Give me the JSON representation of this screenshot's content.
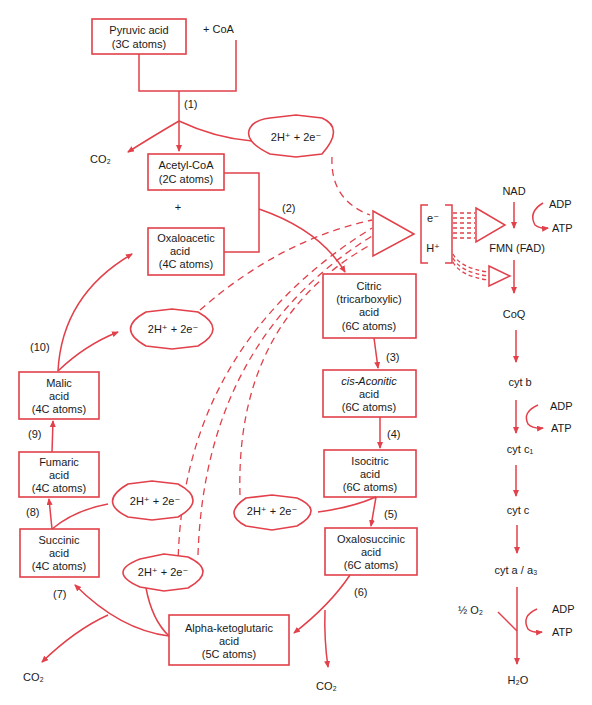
{
  "colors": {
    "line": "#e2404a",
    "text": "#1a1a1a",
    "background": "#ffffff"
  },
  "boxes": {
    "pyruvic": [
      "Pyruvic acid",
      "(3C atoms)"
    ],
    "acetyl": [
      "Acetyl-CoA",
      "(2C atoms)"
    ],
    "oxaloacetic": [
      "Oxaloacetic",
      "acid",
      "(4C atoms)"
    ],
    "citric": [
      "Citric",
      "(tricarboxylic)",
      "acid",
      "(6C atoms)"
    ],
    "cisaconitic": [
      "cis-Aconitic",
      "acid",
      "(6C atoms)"
    ],
    "isocitric": [
      "Isocitric",
      "acid",
      "(6C atoms)"
    ],
    "oxalosuccinic": [
      "Oxalosuccinic",
      "acid",
      "(6C atoms)"
    ],
    "alphaketo": [
      "Alpha-ketoglutaric",
      "acid",
      "(5C atoms)"
    ],
    "succinic": [
      "Succinic",
      "acid",
      "(4C atoms)"
    ],
    "fumaric": [
      "Fumaric",
      "acid",
      "(4C atoms)"
    ],
    "malic": [
      "Malic",
      "acid",
      "(4C atoms)"
    ]
  },
  "labels": {
    "coa": "+ CoA",
    "plus": "+",
    "co2": "CO₂",
    "h2pair": "2H⁺ + 2e⁻",
    "steps": [
      "(1)",
      "(2)",
      "(3)",
      "(4)",
      "(5)",
      "(6)",
      "(7)",
      "(8)",
      "(9)",
      "(10)"
    ],
    "e_minus": "e⁻",
    "h_plus": "H⁺"
  },
  "electron_chain": {
    "carriers": [
      "NAD",
      "FMN (FAD)",
      "CoQ",
      "cyt b",
      "cyt c₁",
      "cyt c",
      "cyt a / a₃",
      "H₂O"
    ],
    "adp": "ADP",
    "atp": "ATP",
    "oxygen": "½ O₂"
  }
}
